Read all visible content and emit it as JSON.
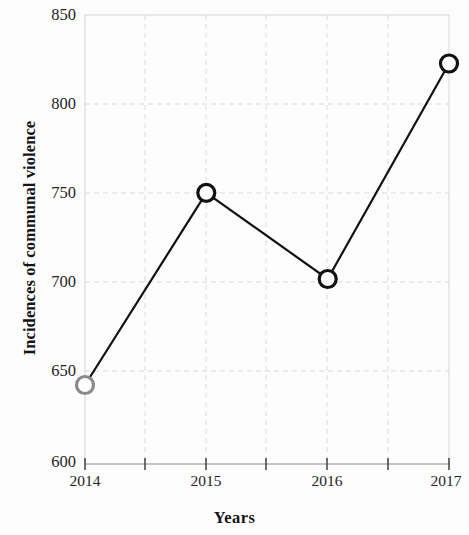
{
  "chart_data": {
    "type": "line",
    "title": "",
    "xlabel": "Years",
    "ylabel": "Incidences of communal violence",
    "categories": [
      "2014",
      "2015",
      "2016",
      "2017"
    ],
    "x": [
      2014,
      2015,
      2016,
      2017
    ],
    "values": [
      644,
      751,
      703,
      823
    ],
    "series": [
      {
        "name": "Incidences of communal violence",
        "values": [
          644,
          751,
          703,
          823
        ]
      }
    ],
    "xlim": [
      2014,
      2017
    ],
    "ylim": [
      600,
      850
    ],
    "y_ticks": [
      600,
      650,
      700,
      750,
      800,
      850
    ],
    "y_tick_labels": [
      "600",
      "650",
      "700",
      "750",
      "800",
      "850"
    ],
    "x_ticks": [
      2014,
      2015,
      2016,
      2017
    ],
    "x_tick_labels": [
      "2014",
      "2015",
      "2016",
      "2017"
    ],
    "x_minor_ticks": [
      2014.5,
      2015.5,
      2016.5
    ],
    "grid": true,
    "grid_style": "dashed",
    "legend": null,
    "legend_position": "none",
    "line_color": "#111111",
    "marker_shape": "circle-open",
    "marker_colors": [
      "#8a8a8a",
      "#111111",
      "#111111",
      "#111111"
    ],
    "grid_color": "#d8d8d8",
    "axis_color": "#cccccc",
    "background_color": "#fdfdfd",
    "annotations": []
  }
}
